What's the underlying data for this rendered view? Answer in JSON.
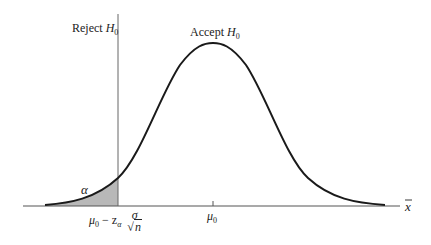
{
  "diagram": {
    "title": "",
    "labels": {
      "reject": "Reject",
      "accept": "Accept",
      "hypothesis": "H",
      "hypothesis_sub": "0",
      "alpha": "α",
      "mu": "μ",
      "mu_sub": "0",
      "critical_minus": " − z",
      "critical_sub": "α",
      "sigma": "σ",
      "sqrt_sym": "√",
      "n": "n",
      "axis_var": "x"
    },
    "colors": {
      "curve": "#1a1a1a",
      "shade": "#b8b8b8",
      "axis": "#555555",
      "critical_line": "#666666"
    },
    "shape": {
      "type": "normal-distribution",
      "mean_label": "μ0",
      "critical_value_label": "μ0 − zα σ/√n",
      "rejection_region": "left-tail",
      "shaded_area_label": "α"
    }
  }
}
